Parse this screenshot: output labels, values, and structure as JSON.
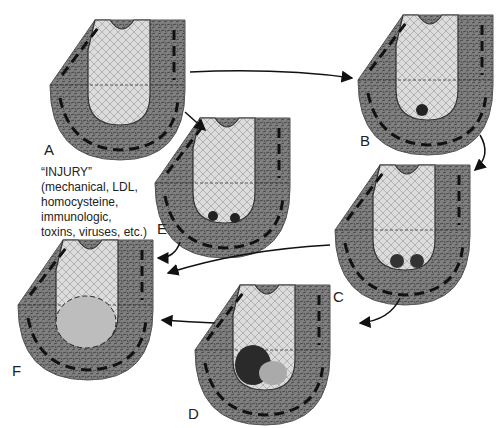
{
  "diagram": {
    "type": "atherosclerosis-progression",
    "panels": [
      {
        "id": "A",
        "label": "A"
      },
      {
        "id": "B",
        "label": "B"
      },
      {
        "id": "C",
        "label": "C"
      },
      {
        "id": "D",
        "label": "D"
      },
      {
        "id": "E",
        "label": "E"
      },
      {
        "id": "F",
        "label": "F"
      }
    ],
    "injury_note": {
      "title": "“INJURY”",
      "lines": [
        "(mechanical, LDL,",
        "homocysteine,",
        "immunologic,",
        "toxins, viruses, etc.)"
      ]
    },
    "arrows": [
      {
        "from": "A",
        "to": "B"
      },
      {
        "from": "A",
        "to": "E"
      },
      {
        "from": "B",
        "to": "C"
      },
      {
        "from": "C",
        "to": "D"
      },
      {
        "from": "C",
        "to": "F"
      },
      {
        "from": "E",
        "to": "F"
      },
      {
        "from": "D",
        "to": "F"
      }
    ],
    "colors": {
      "wall": "#7d7d7d",
      "wall_dark": "#555555",
      "lumen": "#d8d8d8",
      "band": "#1a1a1a"
    }
  }
}
